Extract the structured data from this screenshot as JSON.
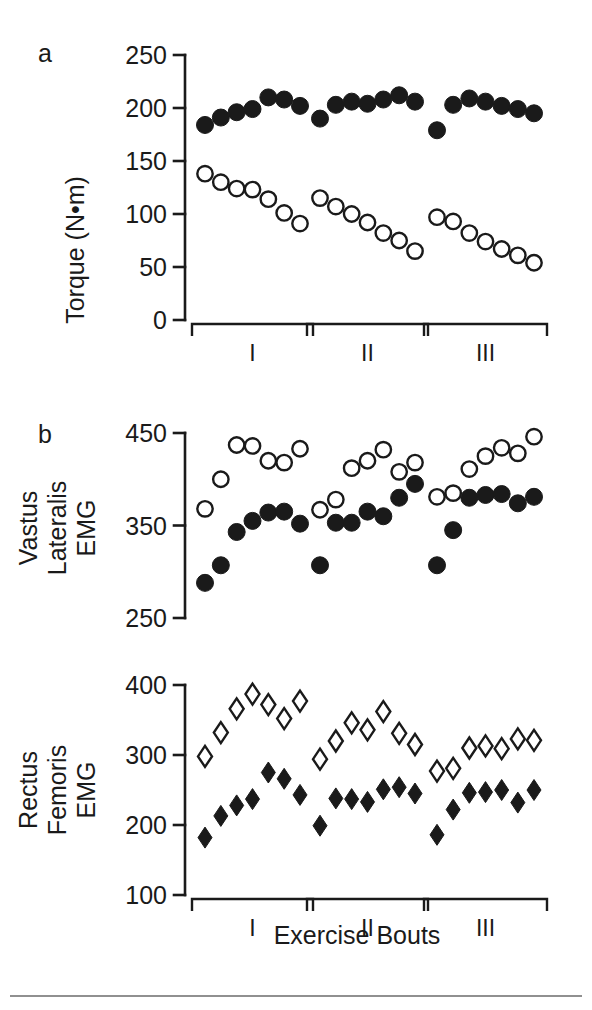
{
  "figure": {
    "background_color": "#ffffff",
    "ink_color": "#1a1a1a",
    "xlabel": "Exercise Bouts",
    "bout_labels": [
      "I",
      "II",
      "III"
    ],
    "footer_rule": true
  },
  "chart_data": [
    {
      "type": "scatter",
      "panel_label": "a",
      "title": "",
      "ylabel": "Torque (N•m)",
      "xlabel": "Exercise Bouts",
      "ylim": [
        0,
        250
      ],
      "yticks": [
        0,
        50,
        100,
        150,
        200,
        250
      ],
      "ytick_labels": [
        "0",
        "50",
        "100",
        "150",
        "200",
        "250"
      ],
      "grid": false,
      "legend": "none",
      "groups": [
        "I",
        "II",
        "III"
      ],
      "reps_per_group": 7,
      "series": [
        {
          "name": "Concentric torque (filled circles)",
          "marker": "filled-circle",
          "values": [
            [
              184,
              191,
              196,
              199,
              210,
              208,
              202
            ],
            [
              190,
              203,
              206,
              204,
              208,
              212,
              206
            ],
            [
              179,
              203,
              209,
              206,
              202,
              199,
              195
            ]
          ]
        },
        {
          "name": "Eccentric/fatigue torque (open circles)",
          "marker": "open-circle",
          "values": [
            [
              138,
              130,
              124,
              123,
              114,
              101,
              91
            ],
            [
              115,
              107,
              100,
              92,
              82,
              75,
              65
            ],
            [
              97,
              93,
              82,
              74,
              67,
              61,
              54
            ]
          ]
        }
      ]
    },
    {
      "type": "scatter",
      "panel_label": "b",
      "title": "",
      "ylabel": "Vastus Lateralis EMG",
      "ylabel_lines": [
        "Vastus",
        "Lateralis",
        "EMG"
      ],
      "xlabel": "Exercise Bouts",
      "ylim": [
        250,
        450
      ],
      "yticks": [
        250,
        350,
        450
      ],
      "ytick_labels": [
        "250",
        "350",
        "450"
      ],
      "grid": false,
      "legend": "none",
      "groups": [
        "I",
        "II",
        "III"
      ],
      "reps_per_group": 7,
      "series": [
        {
          "name": "Open circles",
          "marker": "open-circle",
          "values": [
            [
              368,
              400,
              437,
              436,
              420,
              418,
              433
            ],
            [
              367,
              378,
              412,
              420,
              432,
              408,
              418
            ],
            [
              381,
              385,
              411,
              425,
              434,
              428,
              446
            ]
          ]
        },
        {
          "name": "Filled circles",
          "marker": "filled-circle",
          "values": [
            [
              288,
              307,
              343,
              355,
              364,
              365,
              352
            ],
            [
              307,
              353,
              353,
              365,
              360,
              380,
              395
            ],
            [
              307,
              345,
              380,
              383,
              384,
              374,
              381
            ]
          ]
        }
      ]
    },
    {
      "type": "scatter",
      "panel_label": "",
      "title": "",
      "ylabel": "Rectus Femoris EMG",
      "ylabel_lines": [
        "Rectus",
        "Femoris",
        "EMG"
      ],
      "xlabel": "Exercise Bouts",
      "ylim": [
        100,
        400
      ],
      "yticks": [
        100,
        200,
        300,
        400
      ],
      "ytick_labels": [
        "100",
        "200",
        "300",
        "400"
      ],
      "grid": false,
      "legend": "none",
      "groups": [
        "I",
        "II",
        "III"
      ],
      "reps_per_group": 7,
      "series": [
        {
          "name": "Open diamonds",
          "marker": "open-diamond",
          "values": [
            [
              298,
              332,
              366,
              387,
              372,
              352,
              377
            ],
            [
              294,
              320,
              346,
              336,
              362,
              331,
              315
            ],
            [
              277,
              281,
              310,
              313,
              309,
              323,
              321
            ]
          ]
        },
        {
          "name": "Filled diamonds",
          "marker": "filled-diamond",
          "values": [
            [
              182,
              213,
              228,
              237,
              275,
              266,
              243
            ],
            [
              199,
              238,
              237,
              233,
              251,
              254,
              245
            ],
            [
              186,
              222,
              246,
              247,
              250,
              232,
              250
            ]
          ]
        }
      ]
    }
  ]
}
